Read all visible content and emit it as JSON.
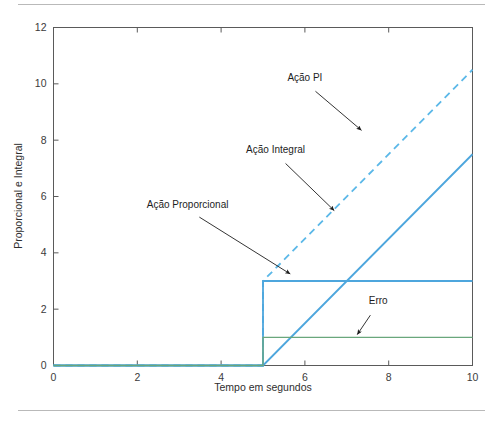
{
  "figure": {
    "background_color": "#ffffff",
    "frame_color": "#5a5a5a",
    "rule_color": "#b9b9b9"
  },
  "chart_data": {
    "type": "line",
    "title": "",
    "subtitle": "",
    "xlabel": "Tempo em segundos",
    "ylabel": "Proporcional e Integral",
    "xlim": [
      0,
      10
    ],
    "ylim": [
      0,
      12
    ],
    "xticks": [
      0,
      2,
      4,
      6,
      8,
      10
    ],
    "yticks": [
      0,
      2,
      4,
      6,
      8,
      10,
      12
    ],
    "xtick_labels": [
      "0",
      "2",
      "4",
      "6",
      "8",
      "10"
    ],
    "ytick_labels": [
      "0",
      "2",
      "4",
      "6",
      "8",
      "10",
      "12"
    ],
    "grid": false,
    "legend": "none",
    "step_time": 5,
    "series": [
      {
        "name": "Ação PI",
        "color": "#5bb8e8",
        "style": "dashed",
        "width": 1.8,
        "x": [
          0,
          5,
          5,
          10
        ],
        "y": [
          0,
          0,
          3,
          10.5
        ]
      },
      {
        "name": "Ação Proporcional",
        "color": "#4da6dd",
        "style": "solid",
        "width": 1.8,
        "x": [
          0,
          5,
          5,
          10
        ],
        "y": [
          0,
          0,
          3,
          3
        ]
      },
      {
        "name": "Ação Integral",
        "color": "#4da6dd",
        "style": "solid",
        "width": 1.8,
        "x": [
          0,
          5,
          10
        ],
        "y": [
          0,
          0,
          7.5
        ]
      },
      {
        "name": "Erro",
        "color": "#6aa77c",
        "style": "solid",
        "width": 1.3,
        "x": [
          0,
          5,
          5,
          10
        ],
        "y": [
          0,
          0,
          1,
          1
        ]
      }
    ],
    "annotations": [
      {
        "text": "Ação PI",
        "label_x": 6.0,
        "label_y": 10.1,
        "tip_x": 7.35,
        "tip_y": 8.35
      },
      {
        "text": "Ação Integral",
        "label_x": 5.3,
        "label_y": 7.55,
        "tip_x": 6.7,
        "tip_y": 5.5
      },
      {
        "text": "Ação Proporcional",
        "label_x": 3.2,
        "label_y": 5.6,
        "tip_x": 5.65,
        "tip_y": 3.25
      },
      {
        "text": "Erro",
        "label_x": 7.75,
        "label_y": 2.2,
        "tip_x": 7.25,
        "tip_y": 1.1
      }
    ]
  }
}
